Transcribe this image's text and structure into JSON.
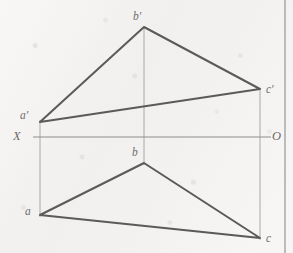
{
  "figure": {
    "kind": "descriptive-geometry-projection",
    "background_color": "#f3f1ef",
    "stroke_color": "#5c5a58",
    "thin_stroke_color": "#9a9896",
    "label_color": "#6f6d6b",
    "ground_line": {
      "left_label": "X",
      "right_label": "O",
      "y": 137,
      "x_start": 33,
      "x_end": 271
    },
    "page_edge_x": 285,
    "frontal_view": {
      "name": "frontal-projection-triangle",
      "labels": [
        "a'",
        "b'",
        "c'"
      ],
      "points": [
        {
          "label": "a'",
          "x": 40,
          "y": 122,
          "label_x": 20,
          "label_y": 110
        },
        {
          "label": "b'",
          "x": 144,
          "y": 27,
          "label_x": 133,
          "label_y": 11
        },
        {
          "label": "c'",
          "x": 260,
          "y": 89,
          "label_x": 266,
          "label_y": 84
        }
      ],
      "polygon": "40,122 144,27 260,89"
    },
    "horizontal_view": {
      "name": "horizontal-projection-triangle",
      "labels": [
        "a",
        "b",
        "c"
      ],
      "points": [
        {
          "label": "a",
          "x": 40,
          "y": 215,
          "label_x": 25,
          "label_y": 206
        },
        {
          "label": "b",
          "x": 144,
          "y": 163,
          "label_x": 132,
          "label_y": 147
        },
        {
          "label": "c",
          "x": 260,
          "y": 238,
          "label_x": 266,
          "label_y": 233
        }
      ],
      "polygon": "40,215 144,163 260,238"
    },
    "projection_lines": [
      {
        "name": "projector-a",
        "x": 40,
        "y1": 120,
        "y2": 217
      },
      {
        "name": "projector-b",
        "x": 144,
        "y1": 27,
        "y2": 165
      },
      {
        "name": "projector-c",
        "x": 260,
        "y1": 88,
        "y2": 240
      }
    ]
  }
}
